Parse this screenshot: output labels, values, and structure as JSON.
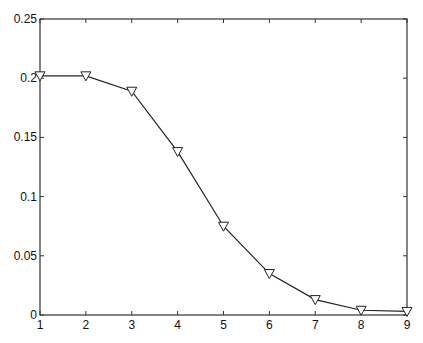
{
  "chart_data": {
    "type": "line",
    "title": "",
    "xlabel": "",
    "ylabel": "",
    "xlim": [
      1,
      9
    ],
    "ylim": [
      0,
      0.25
    ],
    "grid": false,
    "legend": null,
    "marker": "downward-triangle",
    "line_color": "#222222",
    "x": [
      1,
      2,
      3,
      4,
      5,
      6,
      7,
      8,
      9
    ],
    "series": [
      {
        "name": "series-1",
        "values": [
          0.202,
          0.202,
          0.189,
          0.138,
          0.075,
          0.035,
          0.013,
          0.004,
          0.003
        ]
      }
    ],
    "xticks": [
      "1",
      "2",
      "3",
      "4",
      "5",
      "6",
      "7",
      "8",
      "9"
    ],
    "yticks": [
      "0",
      "0.05",
      "0.1",
      "0.15",
      "0.2",
      "0.25"
    ]
  }
}
